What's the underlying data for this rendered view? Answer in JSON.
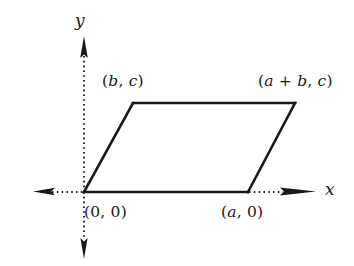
{
  "figure": {
    "type": "coordinate-geometry-diagram",
    "shape": "parallelogram",
    "background_color": "#ffffff",
    "stroke_color": "#1a1a1a",
    "axis_style": "dotted",
    "axes": {
      "x_label": "x",
      "y_label": "y",
      "x_arrow_left": true,
      "x_arrow_right": true,
      "y_arrow_up": true,
      "y_arrow_down": true
    },
    "vertex_labels": {
      "origin": "(0, 0)",
      "bottom_right": "(a, 0)",
      "top_left": "(b, c)",
      "top_right": "(a + b, c)"
    }
  },
  "chart_data": {
    "type": "scatter",
    "title": "",
    "xlabel": "x",
    "ylabel": "y",
    "grid": false,
    "legend": null,
    "annotations": [
      {
        "text": "(0, 0)",
        "vertex": "origin",
        "pixel": [
          84,
          192
        ]
      },
      {
        "text": "(a, 0)",
        "vertex": "bottom-right",
        "pixel": [
          248,
          192
        ]
      },
      {
        "text": "(b, c)",
        "vertex": "top-left",
        "pixel": [
          133,
          103
        ]
      },
      {
        "text": "(a + b, c)",
        "vertex": "top-right",
        "pixel": [
          295,
          103
        ]
      }
    ],
    "polygon_pixels": [
      [
        84,
        192
      ],
      [
        248,
        192
      ],
      [
        295,
        103
      ],
      [
        133,
        103
      ]
    ]
  }
}
